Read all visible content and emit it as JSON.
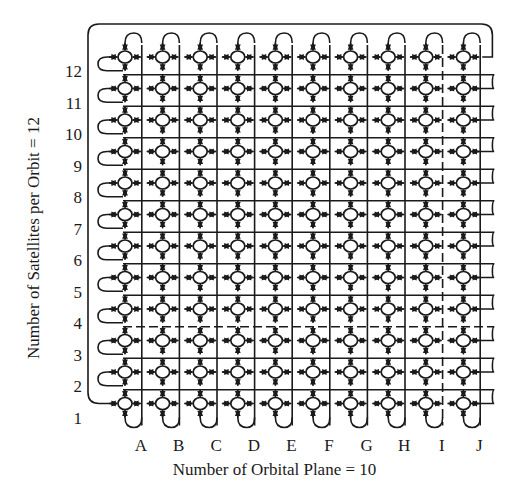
{
  "diagram": {
    "type": "satellite-constellation-torus-mesh",
    "x_axis": {
      "title": "Number of Orbital Plane = 10",
      "labels": [
        "A",
        "B",
        "C",
        "D",
        "E",
        "F",
        "G",
        "H",
        "I",
        "J"
      ]
    },
    "y_axis": {
      "title": "Number of Satellites per Orbit = 12",
      "labels": [
        "1",
        "2",
        "3",
        "4",
        "5",
        "6",
        "7",
        "8",
        "9",
        "10",
        "11",
        "12"
      ]
    },
    "grid": {
      "columns": 10,
      "rows": 12,
      "col_x_first": 125,
      "col_spacing": 37.6,
      "row_y_top": 57,
      "row_spacing": 31.5
    },
    "dashed_lines": {
      "horizontal_between_rows": [
        3,
        4
      ],
      "vertical_between_cols": [
        "I",
        "J"
      ]
    },
    "colors": {
      "stroke": "#1a1a1a",
      "node_fill": "#ffffff",
      "background": "#ffffff"
    }
  }
}
